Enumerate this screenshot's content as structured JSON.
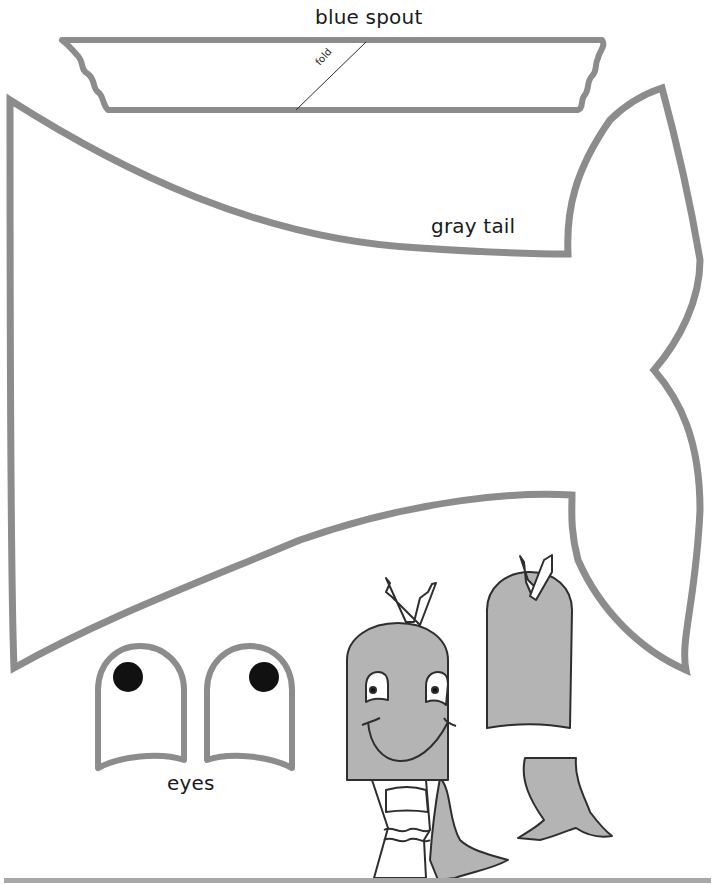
{
  "page": {
    "colors": {
      "outline_gray": "#8c8c8c",
      "puppet_fill": "#b4b4b4",
      "ink": "#1a1a1a",
      "eye_pupil": "#111111",
      "bottom_rule": "#a8a8a8"
    }
  },
  "pieces": {
    "spout": {
      "label": "blue spout",
      "fold_label": "fold",
      "icon": "spout-outline"
    },
    "tail": {
      "label": "gray tail",
      "icon": "whale-tail-outline"
    },
    "eyes": {
      "label": "eyes",
      "count": 2,
      "icon": "eye-outline"
    }
  },
  "illustrations": [
    {
      "name": "finished-whale-puppet-front",
      "description": "Whale puppet on a hand, smiling face, spout on top"
    },
    {
      "name": "finished-whale-puppet-back",
      "description": "Back view of whale puppet with tail"
    }
  ]
}
